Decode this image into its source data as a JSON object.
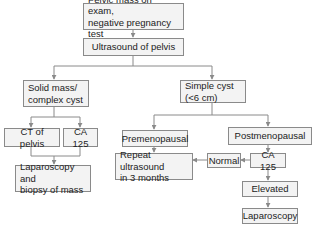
{
  "diagram": {
    "type": "flowchart",
    "nodes": {
      "start": "Pelvic mass on exam,\nnegative pregnancy test",
      "ultrasound": "Ultrasound of pelvis",
      "solid": "Solid mass/\ncomplex cyst",
      "simple": "Simple cyst\n(<6 cm)",
      "ct": "CT of pelvis",
      "ca125_left": "CA 125",
      "lap_biopsy": "Laparoscopy and\nbiopsy of mass",
      "premeno": "Premenopausal",
      "postmeno": "Postmenopausal",
      "repeat_us": "Repeat ultrasound\nin 3 months",
      "normal": "Normal",
      "ca125_right": "CA 125",
      "elevated": "Elevated",
      "laparoscopy": "Laparoscopy"
    },
    "edges": [
      [
        "start",
        "ultrasound"
      ],
      [
        "ultrasound",
        "solid"
      ],
      [
        "ultrasound",
        "simple"
      ],
      [
        "solid",
        "ct"
      ],
      [
        "solid",
        "ca125_left"
      ],
      [
        "ct",
        "lap_biopsy"
      ],
      [
        "ca125_left",
        "lap_biopsy"
      ],
      [
        "simple",
        "premeno"
      ],
      [
        "simple",
        "postmeno"
      ],
      [
        "premeno",
        "repeat_us"
      ],
      [
        "postmeno",
        "ca125_right"
      ],
      [
        "ca125_right",
        "normal"
      ],
      [
        "normal",
        "repeat_us"
      ],
      [
        "ca125_right",
        "elevated"
      ],
      [
        "elevated",
        "laparoscopy"
      ]
    ],
    "colors": {
      "box_fill": "#f3f3f3",
      "box_border": "#8a8a8a",
      "line": "#8a8a8a",
      "text": "#222222"
    }
  }
}
